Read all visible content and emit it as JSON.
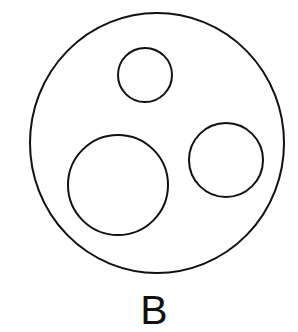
{
  "diagram": {
    "label": "B",
    "stroke_color": "#111111",
    "background": "#ffffff",
    "outer_circle": {
      "cx": 157,
      "cy": 143,
      "rx": 127,
      "ry": 130
    },
    "inner_circles": [
      {
        "name": "small-top-circle",
        "cx": 145,
        "cy": 75,
        "r": 27
      },
      {
        "name": "large-bottom-left-circle",
        "cx": 118,
        "cy": 185,
        "r": 50
      },
      {
        "name": "medium-right-circle",
        "cx": 226,
        "cy": 160,
        "r": 37
      }
    ]
  }
}
